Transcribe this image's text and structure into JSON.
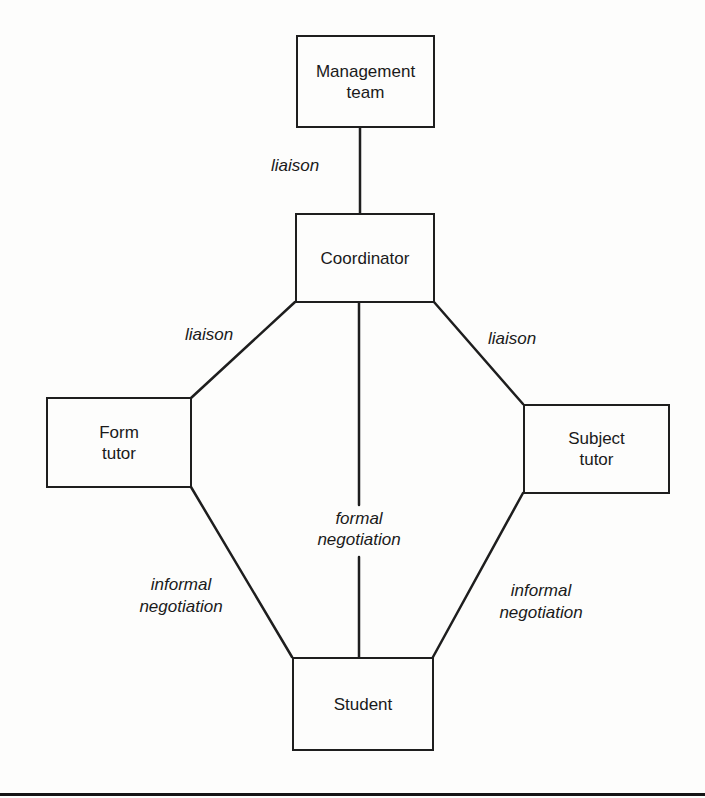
{
  "diagram": {
    "nodes": {
      "management_team": {
        "label": "Management\nteam"
      },
      "coordinator": {
        "label": "Coordinator"
      },
      "form_tutor": {
        "label": "Form\ntutor"
      },
      "subject_tutor": {
        "label": "Subject\ntutor"
      },
      "student": {
        "label": "Student"
      }
    },
    "edges": [
      {
        "from": "management_team",
        "to": "coordinator",
        "label": "liaison"
      },
      {
        "from": "coordinator",
        "to": "form_tutor",
        "label": "liaison"
      },
      {
        "from": "coordinator",
        "to": "subject_tutor",
        "label": "liaison"
      },
      {
        "from": "coordinator",
        "to": "student",
        "label": "formal\nnegotiation"
      },
      {
        "from": "form_tutor",
        "to": "student",
        "label": "informal\nnegotiation"
      },
      {
        "from": "subject_tutor",
        "to": "student",
        "label": "informal\nnegotiation"
      }
    ],
    "colors": {
      "line": "#1e1e1e",
      "background": "#fdfdfc",
      "text": "#1a1a1a"
    }
  }
}
